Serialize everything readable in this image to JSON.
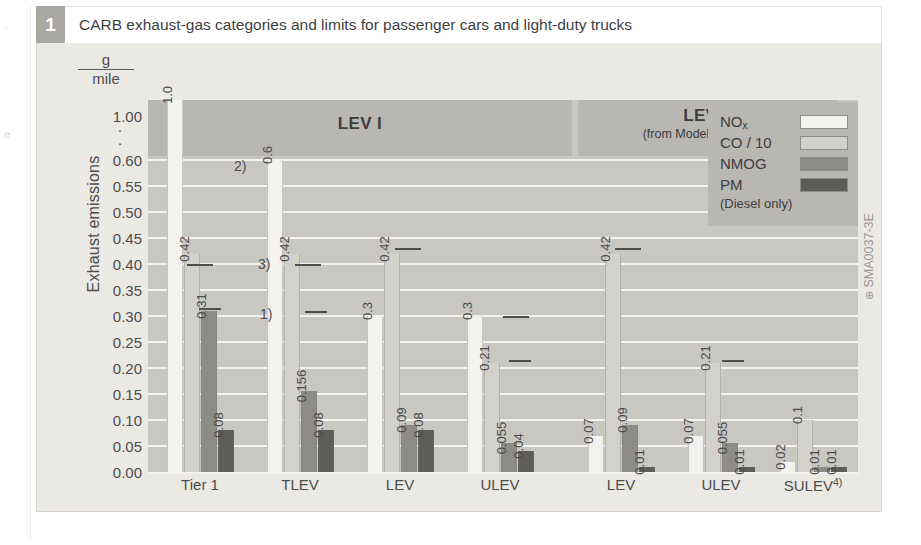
{
  "figure": {
    "number": "1",
    "caption": "CARB exhaust-gas categories and limits for passenger cars and light-duty trucks",
    "id_label": "SMA0037-3E",
    "id_mark": "⊕"
  },
  "axes": {
    "ylabel": "Exhaust emissions",
    "unit_numerator": "g",
    "unit_denominator": "mile",
    "break_marker": "·",
    "yticks": [
      "1.00",
      "0.60",
      "0.55",
      "0.50",
      "0.45",
      "0.40",
      "0.35",
      "0.30",
      "0.25",
      "0.20",
      "0.15",
      "0.10",
      "0.05",
      "0.00"
    ]
  },
  "panels": [
    {
      "title": "LEV I",
      "subtitle": ""
    },
    {
      "title": "LEV II",
      "subtitle": "(from Model Year 2004)"
    }
  ],
  "legend": {
    "items": [
      {
        "label": "NO",
        "sub": "x",
        "color": "#f3f2ef",
        "name": "nox"
      },
      {
        "label": "CO / 10",
        "sub": "",
        "color": "#d3d1cc",
        "name": "co"
      },
      {
        "label": "NMOG",
        "sub": "",
        "color": "#8e8c87",
        "name": "nmog"
      },
      {
        "label": "PM",
        "sub": "",
        "color": "#5e5c58",
        "name": "pm"
      }
    ],
    "note": "(Diesel only)"
  },
  "footnotes": [
    {
      "marker": "1)"
    },
    {
      "marker": "2)"
    },
    {
      "marker": "3)"
    },
    {
      "marker": "4)"
    }
  ],
  "chart_data": {
    "type": "bar",
    "title": "CARB exhaust-gas categories and limits for passenger cars and light-duty trucks",
    "xlabel": "",
    "ylabel": "Exhaust emissions",
    "yunit": "g/mile",
    "ylim": [
      0.0,
      0.65
    ],
    "y_axis_broken": true,
    "y_break_note": "scale breaks above 0.60, top gridline is 1.00",
    "yticks": [
      0.0,
      0.05,
      0.1,
      0.15,
      0.2,
      0.25,
      0.3,
      0.35,
      0.4,
      0.45,
      0.5,
      0.55,
      0.6,
      1.0
    ],
    "grid": true,
    "legend_position": "top-right",
    "categories": [
      "Tier 1",
      "TLEV",
      "LEV",
      "ULEV",
      "LEV",
      "ULEV",
      "SULEV"
    ],
    "category_footnotes": [
      "",
      "",
      "",
      "",
      "",
      "",
      "4)"
    ],
    "groups": [
      "Tier 1",
      "LEV I",
      "LEV I",
      "LEV I",
      "LEV II",
      "LEV II",
      "LEV II"
    ],
    "series": [
      {
        "name": "NOx",
        "values": [
          1.0,
          0.6,
          0.3,
          0.3,
          0.07,
          0.07,
          0.02
        ],
        "labels": [
          "1.0",
          "0.6",
          "0.3",
          "0.3",
          "0.07",
          "0.07",
          "0.02"
        ]
      },
      {
        "name": "CO / 10",
        "values": [
          0.42,
          0.42,
          0.42,
          0.21,
          0.42,
          0.21,
          0.1
        ],
        "labels": [
          "0.42",
          "0.42",
          "0.42",
          "0.21",
          "0.42",
          "0.21",
          "0.1"
        ]
      },
      {
        "name": "NMOG",
        "values": [
          0.31,
          0.156,
          0.09,
          0.055,
          0.09,
          0.055,
          0.01
        ],
        "labels": [
          "0.31",
          "0.156",
          "0.09",
          "0.055",
          "0.09",
          "0.055",
          "0.01"
        ]
      },
      {
        "name": "PM",
        "values": [
          0.08,
          0.08,
          0.08,
          0.04,
          0.01,
          0.01,
          0.01
        ],
        "labels": [
          "0.08",
          "0.08",
          "0.08",
          "0.04",
          "0.01",
          "0.01",
          "0.01"
        ]
      }
    ],
    "annotations": [
      {
        "text": "1)",
        "near": "Tier 1 NMOG"
      },
      {
        "text": "2)",
        "near": "TLEV NOx"
      },
      {
        "text": "3)",
        "near": "TLEV CO"
      }
    ]
  }
}
